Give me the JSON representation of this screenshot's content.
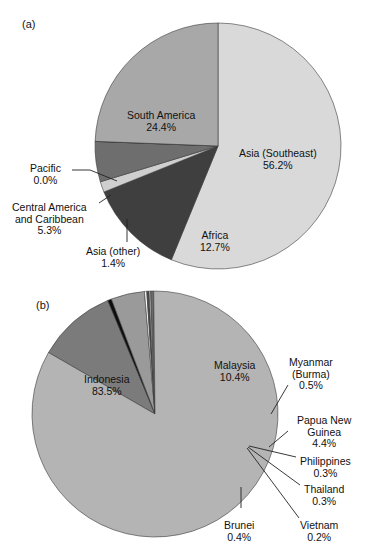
{
  "figure": {
    "panels": [
      {
        "letter": "(a)",
        "letter_pos": {
          "x": 22,
          "y": 18
        },
        "pie": {
          "cx": 218,
          "cy": 146,
          "r": 123,
          "start_angle_deg": 0
        },
        "slices": [
          {
            "name": "Asia (Southeast)",
            "value": 56.2,
            "label": "Asia (Southeast)",
            "pct": "56.2%",
            "color": "#d9d9d9"
          },
          {
            "name": "Africa",
            "value": 12.7,
            "label": "Africa",
            "pct": "12.7%",
            "color": "#3f3f3f"
          },
          {
            "name": "Asia (other)",
            "value": 1.4,
            "label": "Asia (other)",
            "pct": "1.4%",
            "color": "#cfcfcf"
          },
          {
            "name": "Central America and Caribbean",
            "value": 5.3,
            "label": "Central America and Caribbean",
            "pct": "5.3%",
            "color": "#6e6e6e"
          },
          {
            "name": "Pacific",
            "value": 0.0,
            "label": "Pacific",
            "pct": "0.0%",
            "color": "#8f8f8f"
          },
          {
            "name": "South America",
            "value": 24.4,
            "label": "South America",
            "pct": "24.4%",
            "color": "#a8a8a8"
          }
        ],
        "labels": [
          {
            "key": "asia-southeast",
            "lines": [
              "Asia (Southeast)",
              "56.2%"
            ],
            "x": 239,
            "y": 148,
            "align": "ctr",
            "inside": true
          },
          {
            "key": "south-america",
            "lines": [
              "South America",
              "24.4%"
            ],
            "x": 127,
            "y": 110,
            "align": "ctr",
            "inside": true
          },
          {
            "key": "africa",
            "lines": [
              "Africa",
              "12.7%"
            ],
            "x": 200,
            "y": 230,
            "align": "ctr",
            "inside": true
          },
          {
            "key": "pacific",
            "lines": [
              "Pacific",
              "0.0%"
            ],
            "x": 30,
            "y": 163,
            "align": "ctr",
            "inside": false
          },
          {
            "key": "central-america",
            "lines": [
              "Central America",
              "and Caribbean",
              "5.3%"
            ],
            "x": 12,
            "y": 202,
            "align": "ctr",
            "inside": false
          },
          {
            "key": "asia-other",
            "lines": [
              "Asia (other)",
              "1.4%"
            ],
            "x": 86,
            "y": 246,
            "align": "ctr",
            "inside": false
          }
        ],
        "leaders": [
          {
            "key": "pacific-leader",
            "points": "72,170 90,170 117,181"
          },
          {
            "key": "central-america-leader",
            "points": "99,203 111,195"
          },
          {
            "key": "asia-other-leader",
            "points": "127,219 127,242"
          }
        ]
      },
      {
        "letter": "(b)",
        "letter_pos": {
          "x": 36,
          "y": 299
        },
        "pie": {
          "cx": 155,
          "cy": 414,
          "r": 123,
          "start_angle_deg": 300
        },
        "slices": [
          {
            "name": "Malaysia",
            "value": 10.4,
            "label": "Malaysia",
            "pct": "10.4%",
            "color": "#7b7b7b"
          },
          {
            "name": "Myanmar (Burma)",
            "value": 0.5,
            "label": "Myanmar (Burma)",
            "pct": "0.5%",
            "color": "#0d0d0d"
          },
          {
            "name": "Papua New Guinea",
            "value": 4.4,
            "label": "Papua New Guinea",
            "pct": "4.4%",
            "color": "#9a9a9a"
          },
          {
            "name": "Philippines",
            "value": 0.3,
            "label": "Philippines",
            "pct": "0.3%",
            "color": "#ffffff"
          },
          {
            "name": "Thailand",
            "value": 0.3,
            "label": "Thailand",
            "pct": "0.3%",
            "color": "#4a4a4a"
          },
          {
            "name": "Vietnam",
            "value": 0.2,
            "label": "Vietnam",
            "pct": "0.2%",
            "color": "#e8e8e8"
          },
          {
            "name": "Brunei",
            "value": 0.4,
            "label": "Brunei",
            "pct": "0.4%",
            "color": "#6a6a6a"
          },
          {
            "name": "Indonesia",
            "value": 83.5,
            "label": "Indonesia",
            "pct": "83.5%",
            "color": "#b4b4b4"
          }
        ],
        "labels": [
          {
            "key": "indonesia",
            "lines": [
              "Indonesia",
              "83.5%"
            ],
            "x": 84,
            "y": 374,
            "align": "ctr",
            "inside": true
          },
          {
            "key": "malaysia",
            "lines": [
              "Malaysia",
              "10.4%"
            ],
            "x": 214,
            "y": 360,
            "align": "ctr",
            "inside": true
          },
          {
            "key": "myanmar",
            "lines": [
              "Myanmar",
              "(Burma)",
              "0.5%"
            ],
            "x": 289,
            "y": 357,
            "align": "ctr",
            "inside": false
          },
          {
            "key": "papua-new-guinea",
            "lines": [
              "Papua New",
              "Guinea",
              "4.4%"
            ],
            "x": 297,
            "y": 415,
            "align": "ctr",
            "inside": false
          },
          {
            "key": "philippines",
            "lines": [
              "Philippines",
              "0.3%"
            ],
            "x": 300,
            "y": 456,
            "align": "ctr",
            "inside": false
          },
          {
            "key": "thailand",
            "lines": [
              "Thailand",
              "0.3%"
            ],
            "x": 304,
            "y": 484,
            "align": "ctr",
            "inside": false
          },
          {
            "key": "vietnam",
            "lines": [
              "Vietnam",
              "0.2%"
            ],
            "x": 300,
            "y": 520,
            "align": "ctr",
            "inside": false
          },
          {
            "key": "brunei",
            "lines": [
              "Brunei",
              "0.4%"
            ],
            "x": 224,
            "y": 520,
            "align": "ctr",
            "inside": false
          }
        ],
        "leaders": [
          {
            "key": "myanmar-leader",
            "points": "288,385 271,414"
          },
          {
            "key": "papua-leader",
            "points": "288,431 269,447"
          },
          {
            "key": "philippines-leader",
            "points": "296,457 249,446"
          },
          {
            "key": "thailand-leader",
            "points": "300,485 248,447"
          },
          {
            "key": "vietnam-leader",
            "points": "299,518 247,448"
          },
          {
            "key": "brunei-leader",
            "points": "241,508 241,487"
          }
        ]
      }
    ]
  },
  "chart_data": [
    {
      "type": "pie",
      "id": "panel-a",
      "title": "(a)",
      "categories": [
        "Asia (Southeast)",
        "South America",
        "Africa",
        "Central America and Caribbean",
        "Asia (other)",
        "Pacific"
      ],
      "values": [
        56.2,
        24.4,
        12.7,
        5.3,
        1.4,
        0.0
      ],
      "value_labels": [
        "56.2%",
        "24.4%",
        "12.7%",
        "5.3%",
        "1.4%",
        "0.0%"
      ],
      "units": "percent",
      "legend": "none (direct labels with leader lines)",
      "colors": [
        "#d9d9d9",
        "#a8a8a8",
        "#3f3f3f",
        "#6e6e6e",
        "#cfcfcf",
        "#8f8f8f"
      ]
    },
    {
      "type": "pie",
      "id": "panel-b",
      "title": "(b)",
      "categories": [
        "Indonesia",
        "Malaysia",
        "Papua New Guinea",
        "Myanmar (Burma)",
        "Brunei",
        "Philippines",
        "Thailand",
        "Vietnam"
      ],
      "values": [
        83.5,
        10.4,
        4.4,
        0.5,
        0.4,
        0.3,
        0.3,
        0.2
      ],
      "value_labels": [
        "83.5%",
        "10.4%",
        "4.4%",
        "0.5%",
        "0.4%",
        "0.3%",
        "0.3%",
        "0.2%"
      ],
      "units": "percent",
      "legend": "none (direct labels with leader lines)",
      "colors": [
        "#b4b4b4",
        "#7b7b7b",
        "#9a9a9a",
        "#0d0d0d",
        "#6a6a6a",
        "#ffffff",
        "#4a4a4a",
        "#e8e8e8"
      ]
    }
  ]
}
